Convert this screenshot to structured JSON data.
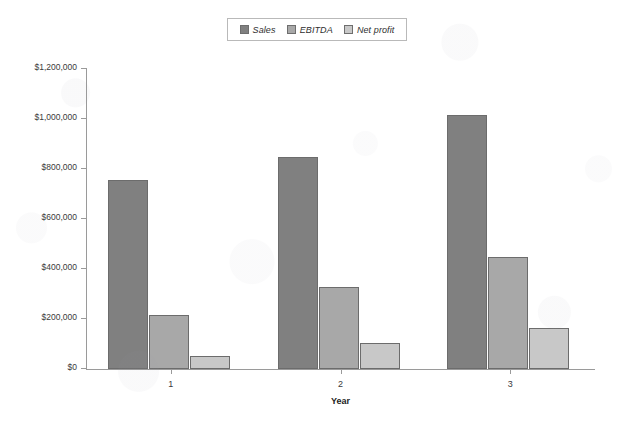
{
  "chart_data": {
    "type": "bar",
    "title": "",
    "xlabel": "Year",
    "ylabel": "",
    "categories": [
      "1",
      "2",
      "3"
    ],
    "series": [
      {
        "name": "Sales",
        "color": "#808080",
        "values": [
          755000,
          850000,
          1015000
        ]
      },
      {
        "name": "EBITDA",
        "color": "#a8a8a8",
        "values": [
          215000,
          330000,
          450000
        ]
      },
      {
        "name": "Net profit",
        "color": "#c8c8c8",
        "values": [
          52000,
          105000,
          165000
        ]
      }
    ],
    "ylim": [
      0,
      1200000
    ],
    "ytick_values": [
      0,
      200000,
      400000,
      600000,
      800000,
      1000000,
      1200000
    ],
    "ytick_labels": [
      "$0",
      "$200,000",
      "$400,000",
      "$600,000",
      "$800,000",
      "$1,000,000",
      "$1,200,000"
    ],
    "grid": false,
    "legend_position": "top-center"
  },
  "legend": {
    "items": [
      {
        "label": "Sales"
      },
      {
        "label": "EBITDA"
      },
      {
        "label": "Net profit"
      }
    ]
  },
  "axes": {
    "x_title": "Year"
  }
}
